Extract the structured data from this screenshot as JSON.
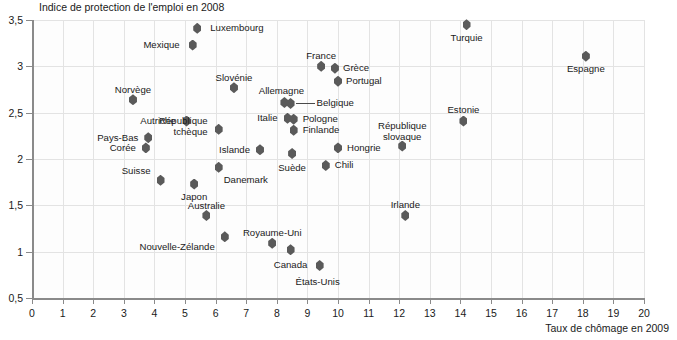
{
  "chart_data": {
    "type": "scatter",
    "title": "",
    "ylabel": "Indice de protection de l'emploi en 2008",
    "xlabel": "Taux de chômage en 2009",
    "xlim": [
      0,
      20
    ],
    "ylim": [
      0.5,
      3.5
    ],
    "xticks": [
      "0",
      "1",
      "2",
      "3",
      "4",
      "5",
      "6",
      "7",
      "8",
      "9",
      "10",
      "11",
      "12",
      "13",
      "14",
      "15",
      "16",
      "17",
      "18",
      "19",
      "20"
    ],
    "yticks": [
      "0,5",
      "1",
      "1,5",
      "2",
      "2,5",
      "3",
      "3,5"
    ],
    "grid": true,
    "legend": "none",
    "marker_color": "#5a5a5a",
    "points": [
      {
        "label": "Luxembourg",
        "x": 5.4,
        "y": 3.41,
        "lx": 13,
        "ly": -5,
        "align": "left"
      },
      {
        "label": "Mexique",
        "x": 5.25,
        "y": 3.23,
        "lx": -13,
        "ly": -5,
        "align": "right"
      },
      {
        "label": "Turquie",
        "x": 14.2,
        "y": 3.45,
        "lx": 0,
        "ly": 8,
        "align": "center"
      },
      {
        "label": "Espagne",
        "x": 18.1,
        "y": 3.11,
        "lx": 0,
        "ly": 8,
        "align": "center"
      },
      {
        "label": "France",
        "x": 9.45,
        "y": 3.0,
        "lx": 0,
        "ly": -15,
        "align": "center"
      },
      {
        "label": "Grèce",
        "x": 9.9,
        "y": 2.98,
        "lx": 8,
        "ly": -5,
        "align": "left"
      },
      {
        "label": "Portugal",
        "x": 10.0,
        "y": 2.84,
        "lx": 8,
        "ly": -5,
        "align": "left"
      },
      {
        "label": "Slovénie",
        "x": 6.6,
        "y": 2.77,
        "lx": 0,
        "ly": -15,
        "align": "center"
      },
      {
        "label": "Allemagne",
        "x": 8.25,
        "y": 2.61,
        "lx": -3,
        "ly": -16,
        "align": "center"
      },
      {
        "label": "Belgique",
        "x": 8.45,
        "y": 2.6,
        "lx": 26,
        "ly": -5,
        "align": "left"
      },
      {
        "label": "Norvège",
        "x": 3.3,
        "y": 2.64,
        "lx": 0,
        "ly": -15,
        "align": "center"
      },
      {
        "label": "Autriche",
        "x": 5.05,
        "y": 2.41,
        "lx": -11,
        "ly": -5,
        "align": "right"
      },
      {
        "label": "République\ntchèque",
        "x": 6.1,
        "y": 2.32,
        "lx": -11,
        "ly": -13,
        "align": "right"
      },
      {
        "label": "Italie",
        "x": 8.35,
        "y": 2.44,
        "lx": -10,
        "ly": -5,
        "align": "right"
      },
      {
        "label": "Pologne",
        "x": 8.55,
        "y": 2.43,
        "lx": 9,
        "ly": -5,
        "align": "left"
      },
      {
        "label": "Finlande",
        "x": 8.55,
        "y": 2.31,
        "lx": 9,
        "ly": -5,
        "align": "left"
      },
      {
        "label": "Pays-Bas",
        "x": 3.8,
        "y": 2.23,
        "lx": -10,
        "ly": -5,
        "align": "right"
      },
      {
        "label": "Corée",
        "x": 3.72,
        "y": 2.12,
        "lx": -10,
        "ly": -5,
        "align": "right"
      },
      {
        "label": "Islande",
        "x": 7.45,
        "y": 2.1,
        "lx": -10,
        "ly": -5,
        "align": "right"
      },
      {
        "label": "Suède",
        "x": 8.5,
        "y": 2.06,
        "lx": 0,
        "ly": 10,
        "align": "center"
      },
      {
        "label": "Hongrie",
        "x": 10.0,
        "y": 2.12,
        "lx": 9,
        "ly": -5,
        "align": "left"
      },
      {
        "label": "République\nslovaque",
        "x": 12.1,
        "y": 2.14,
        "lx": 0,
        "ly": -25,
        "align": "center"
      },
      {
        "label": "Estonie",
        "x": 14.1,
        "y": 2.41,
        "lx": 0,
        "ly": -16,
        "align": "center"
      },
      {
        "label": "Chili",
        "x": 9.6,
        "y": 1.93,
        "lx": 9,
        "ly": -5,
        "align": "left"
      },
      {
        "label": "Suisse",
        "x": 4.2,
        "y": 1.77,
        "lx": -10,
        "ly": -14,
        "align": "right"
      },
      {
        "label": "Japon",
        "x": 5.3,
        "y": 1.73,
        "lx": 0,
        "ly": 8,
        "align": "center"
      },
      {
        "label": "Danemark",
        "x": 6.1,
        "y": 1.91,
        "lx": 5,
        "ly": 8,
        "align": "left"
      },
      {
        "label": "Australie",
        "x": 5.7,
        "y": 1.39,
        "lx": 0,
        "ly": -15,
        "align": "center"
      },
      {
        "label": "Irlande",
        "x": 12.2,
        "y": 1.39,
        "lx": 0,
        "ly": -16,
        "align": "center"
      },
      {
        "label": "Nouvelle-Zélande",
        "x": 6.3,
        "y": 1.16,
        "lx": -10,
        "ly": 5,
        "align": "right"
      },
      {
        "label": "Royaume-Uni",
        "x": 7.85,
        "y": 1.09,
        "lx": 0,
        "ly": -15,
        "align": "center"
      },
      {
        "label": "Canada",
        "x": 8.45,
        "y": 1.02,
        "lx": 0,
        "ly": 10,
        "align": "center"
      },
      {
        "label": "États-Unis",
        "x": 9.4,
        "y": 0.85,
        "lx": -2,
        "ly": 11,
        "align": "center"
      }
    ]
  }
}
